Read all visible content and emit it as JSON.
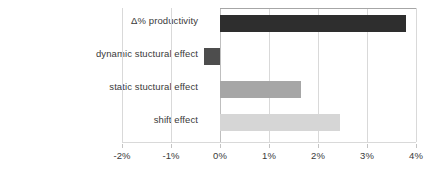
{
  "chart_data": {
    "type": "bar",
    "orientation": "horizontal",
    "title": "",
    "xlabel": "",
    "ylabel": "",
    "categories": [
      "Δ% productivity",
      "dynamic stuctural effect",
      "static stuctural effect",
      "shift effect"
    ],
    "values": [
      3.8,
      -0.33,
      1.65,
      2.45
    ],
    "value_format": "percent",
    "xlim": [
      -2,
      4
    ],
    "xticks": [
      -2,
      -1,
      0,
      1,
      2,
      3,
      4
    ],
    "xtick_labels": [
      "-2%",
      "-1%",
      "0%",
      "1%",
      "2%",
      "3%",
      "4%"
    ],
    "grid": true,
    "legend": false,
    "bar_colors": [
      "#2e2e2e",
      "#4d4d4d",
      "#a6a6a6",
      "#d6d6d6"
    ],
    "gridline_color": "#d9d9d9",
    "zero_line_color": "#bfbfbf",
    "background_color": "#ffffff",
    "text_color": "#3a3a3a"
  }
}
